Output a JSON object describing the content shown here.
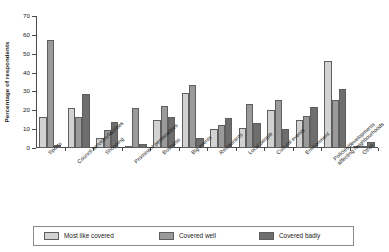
{
  "chart_data": {
    "type": "bar",
    "title": "",
    "xlabel": "",
    "ylabel": "Percentage of respondents",
    "ylim": [
      0,
      70
    ],
    "ytick_labels": [
      "0",
      "10",
      "20",
      "30",
      "40",
      "50",
      "60",
      "70"
    ],
    "ytick_values": [
      0,
      10,
      20,
      30,
      40,
      50,
      60,
      70
    ],
    "grid": false,
    "legend_position": "bottom",
    "categories": [
      "Sports",
      "Council services/facilities",
      "Shopping",
      "Prominent personalities",
      "Business",
      "Big events",
      "Restaurants",
      "Local people",
      "Cultural events",
      "Environment",
      "Policies/developments affecting neighbourhoods",
      "Other"
    ],
    "series": [
      {
        "name": "Most like covered",
        "color": "#d2d2d2",
        "values": [
          16.5,
          21,
          5.5,
          0.4,
          14.7,
          29.2,
          10.2,
          10.4,
          20.3,
          15,
          46,
          0.9
        ]
      },
      {
        "name": "Covered well",
        "color": "#9a9a9a",
        "values": [
          57.5,
          16.3,
          9.8,
          21,
          22.5,
          33.5,
          12.4,
          23.5,
          25.2,
          17,
          25.3,
          1.3
        ]
      },
      {
        "name": "Covered badly",
        "color": "#6e6e6e",
        "values": [
          1.6,
          28.5,
          13.8,
          2.2,
          16.7,
          5.2,
          15.9,
          13.2,
          9.9,
          21.5,
          31.3,
          3.4
        ]
      }
    ]
  },
  "legend": {
    "items": [
      {
        "label": "Most like covered"
      },
      {
        "label": "Covered well"
      },
      {
        "label": "Covered badly"
      }
    ]
  }
}
